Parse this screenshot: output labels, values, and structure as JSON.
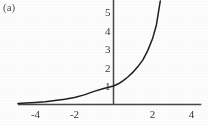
{
  "figure": {
    "panel_label": "(a)",
    "background_color": "#fefefe",
    "axis_color": "#4a4a4a",
    "curve_color": "#1f1f1f"
  },
  "chart_data": {
    "type": "line",
    "title": "",
    "subtitle": "",
    "xlabel": "",
    "ylabel": "",
    "annotation": "(a)",
    "grid": false,
    "legend": null,
    "legend_position": "none",
    "xlim": [
      -4.9,
      4.5
    ],
    "ylim": [
      -0.35,
      5.65
    ],
    "xticks": [
      -4,
      -2,
      2,
      4
    ],
    "yticks": [
      1,
      2,
      3,
      4,
      5
    ],
    "xtick_labels": [
      "-4",
      "-2",
      "2",
      "4"
    ],
    "ytick_labels": [
      "1",
      "2",
      "3",
      "4",
      "5"
    ],
    "series": [
      {
        "name": "exponential",
        "x": [
          -4.9,
          -4.5,
          -4.0,
          -3.5,
          -3.0,
          -2.5,
          -2.0,
          -1.5,
          -1.0,
          -0.5,
          0.0,
          0.25,
          0.5,
          0.75,
          1.0,
          1.25,
          1.5,
          1.75,
          2.0,
          2.2,
          2.4
        ],
        "y": [
          0.06,
          0.08,
          0.11,
          0.15,
          0.21,
          0.28,
          0.38,
          0.52,
          0.71,
          0.87,
          1.0,
          1.12,
          1.29,
          1.5,
          1.75,
          2.05,
          2.4,
          2.9,
          3.55,
          4.3,
          5.6
        ]
      }
    ]
  },
  "axes": {
    "x_axis_label": "x-axis",
    "y_axis_label": "y-axis"
  }
}
